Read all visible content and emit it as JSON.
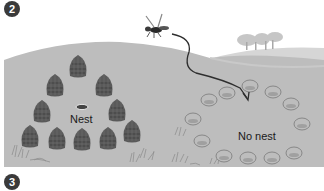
{
  "figure": {
    "step_badges": [
      {
        "number": "2",
        "x": 4,
        "y": 1
      },
      {
        "number": "3",
        "x": 4,
        "y": 174
      }
    ],
    "labels": {
      "nest": "Nest",
      "no_nest": "No nest"
    },
    "colors": {
      "background": "#ffffff",
      "ground": "#b9b9b9",
      "far_hill": "#d4d4d4",
      "pinecone": "#5a5a5a",
      "stone_fill": "#bdbdbd",
      "stone_outline": "#7a7a7a",
      "flight_path": "#2e2e2e",
      "badge": "#3a3a3a"
    },
    "pinecones": [
      {
        "x": 78,
        "y": 68
      },
      {
        "x": 55,
        "y": 87
      },
      {
        "x": 104,
        "y": 87
      },
      {
        "x": 42,
        "y": 113
      },
      {
        "x": 117,
        "y": 112
      },
      {
        "x": 30,
        "y": 138
      },
      {
        "x": 57,
        "y": 140
      },
      {
        "x": 82,
        "y": 141
      },
      {
        "x": 108,
        "y": 140
      },
      {
        "x": 132,
        "y": 133
      }
    ],
    "nest_hole": {
      "x": 82,
      "y": 107
    },
    "stones": [
      {
        "x": 250,
        "y": 86
      },
      {
        "x": 227,
        "y": 93
      },
      {
        "x": 209,
        "y": 100
      },
      {
        "x": 273,
        "y": 92
      },
      {
        "x": 291,
        "y": 104
      },
      {
        "x": 193,
        "y": 119
      },
      {
        "x": 302,
        "y": 124
      },
      {
        "x": 202,
        "y": 141
      },
      {
        "x": 224,
        "y": 156
      },
      {
        "x": 248,
        "y": 158
      },
      {
        "x": 272,
        "y": 158
      },
      {
        "x": 294,
        "y": 153
      }
    ]
  }
}
